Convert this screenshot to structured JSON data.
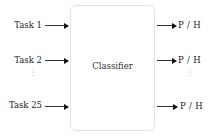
{
  "diagram": {
    "center_label": "Classifier",
    "inputs": [
      {
        "label": "Task 1"
      },
      {
        "label": "Task 2"
      },
      {
        "label": "Task 25"
      }
    ],
    "outputs": [
      {
        "label": "P / H"
      },
      {
        "label": "P / H"
      },
      {
        "label": "P / H"
      }
    ],
    "ellipsis": "⋮"
  }
}
